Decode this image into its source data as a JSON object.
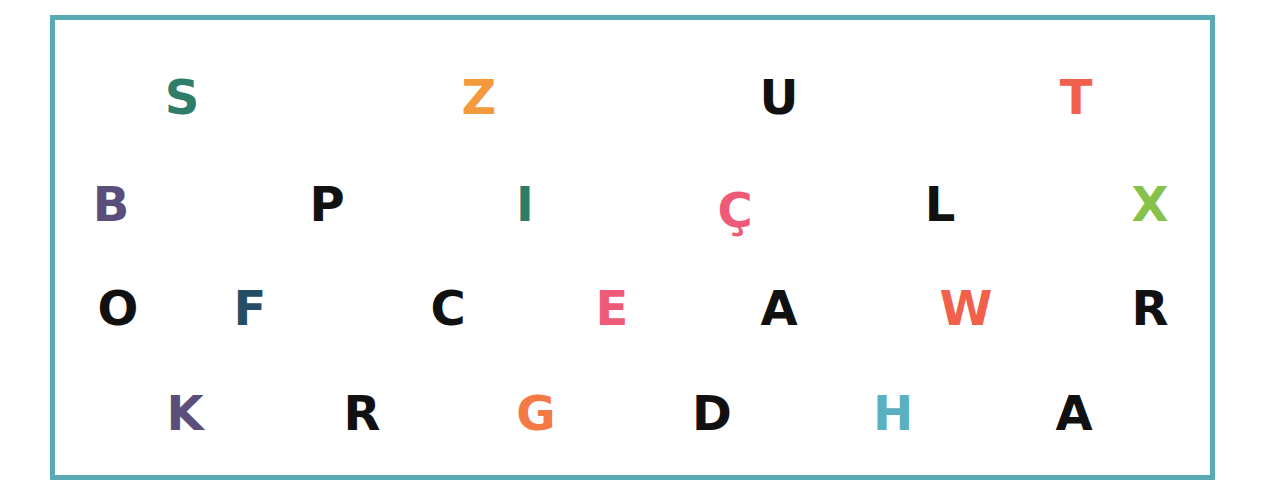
{
  "letters": [
    {
      "char": "S",
      "x": 182,
      "y": 97,
      "color": "#2e7d6a"
    },
    {
      "char": "Z",
      "x": 479,
      "y": 97,
      "color": "#f59a3c"
    },
    {
      "char": "U",
      "x": 779,
      "y": 97,
      "color": "#111111"
    },
    {
      "char": "T",
      "x": 1076,
      "y": 97,
      "color": "#f0604a"
    },
    {
      "char": "B",
      "x": 111,
      "y": 204,
      "color": "#5b4e7a"
    },
    {
      "char": "P",
      "x": 327,
      "y": 204,
      "color": "#111111"
    },
    {
      "char": "I",
      "x": 525,
      "y": 204,
      "color": "#2e7d6a"
    },
    {
      "char": "Ç",
      "x": 735,
      "y": 210,
      "color": "#ee5a78"
    },
    {
      "char": "L",
      "x": 940,
      "y": 204,
      "color": "#111111"
    },
    {
      "char": "X",
      "x": 1150,
      "y": 204,
      "color": "#86c24a"
    },
    {
      "char": "O",
      "x": 118,
      "y": 308,
      "color": "#111111"
    },
    {
      "char": "F",
      "x": 250,
      "y": 308,
      "color": "#254e64"
    },
    {
      "char": "C",
      "x": 448,
      "y": 308,
      "color": "#111111"
    },
    {
      "char": "E",
      "x": 612,
      "y": 308,
      "color": "#ee5a78"
    },
    {
      "char": "A",
      "x": 779,
      "y": 308,
      "color": "#111111"
    },
    {
      "char": "W",
      "x": 966,
      "y": 308,
      "color": "#f0604a"
    },
    {
      "char": "R",
      "x": 1150,
      "y": 308,
      "color": "#111111"
    },
    {
      "char": "K",
      "x": 185,
      "y": 413,
      "color": "#5b4e7a"
    },
    {
      "char": "R",
      "x": 362,
      "y": 413,
      "color": "#111111"
    },
    {
      "char": "G",
      "x": 536,
      "y": 413,
      "color": "#f37a45"
    },
    {
      "char": "D",
      "x": 712,
      "y": 413,
      "color": "#111111"
    },
    {
      "char": "H",
      "x": 893,
      "y": 413,
      "color": "#5ab0c0"
    },
    {
      "char": "A",
      "x": 1074,
      "y": 413,
      "color": "#111111"
    }
  ],
  "frame_color": "#5aaab6"
}
